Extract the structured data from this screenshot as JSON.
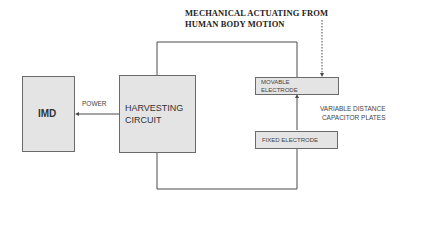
{
  "diagram": {
    "title_line1": "MECHANICAL ACTUATING FROM",
    "title_line2": "HUMAN BODY MOTION",
    "imd": "IMD",
    "power": "POWER",
    "harvesting_line1": "HARVESTING",
    "harvesting_line2": "CIRCUIT",
    "movable_line1": "MOVABLE",
    "movable_line2": "ELECTRODE",
    "fixed": "FIXED ELECTRODE",
    "capacitor_line1": "VARIABLE DISTANCE",
    "capacitor_line2": "CAPACITOR PLATES"
  }
}
